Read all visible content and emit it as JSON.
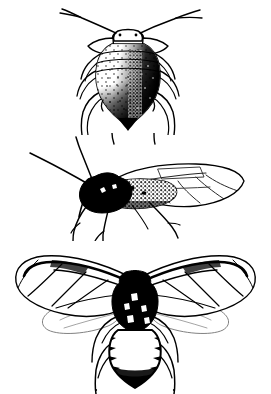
{
  "plate": {
    "title": "Aphid life-stage illustration plate",
    "description": "Three black-and-white line-and-stipple scientific illustrations of aphids stacked vertically on a plain white background.",
    "background_color": "#ffffff",
    "ink_color": "#000000",
    "width_px": 271,
    "height_px": 394,
    "figure_count": 3
  },
  "figures": [
    {
      "id": "figure-1",
      "label": "Wingless adult aphid, dorsal view",
      "subject": "apterous-aphid",
      "view": "dorsal",
      "winged": false,
      "position": {
        "top_px": 0,
        "height_px": 135
      },
      "features": {
        "antennae": 2,
        "legs": 6,
        "body_shape": "pear-shaped abdomen",
        "shading": "heavy stipple on right flank and posterior, light stipple dots on left",
        "segments": 4,
        "cornicles": 2
      }
    },
    {
      "id": "figure-2",
      "label": "Winged adult aphid, lateral view",
      "subject": "alate-aphid",
      "view": "lateral",
      "winged": true,
      "position": {
        "top_px": 133,
        "height_px": 108
      },
      "features": {
        "antennae": 2,
        "legs": 6,
        "wings": 2,
        "body_shape": "elongate, head and thorax solid black",
        "shading": "solid black head and thorax, stippled abdomen, translucent veined wing",
        "wing_veins": 5
      }
    },
    {
      "id": "figure-3",
      "label": "Winged adult aphid, dorsal view with wings spread",
      "subject": "alate-aphid",
      "view": "dorsal",
      "winged": true,
      "position": {
        "top_px": 238,
        "height_px": 156
      },
      "features": {
        "antennae": 2,
        "legs": 6,
        "wings": 4,
        "body_shape": "solid black head and thorax, pale segmented abdomen with dark tip",
        "shading": "forewings outlined with dark veins, hindwings faint and pale",
        "wing_pairs": 2
      }
    }
  ]
}
